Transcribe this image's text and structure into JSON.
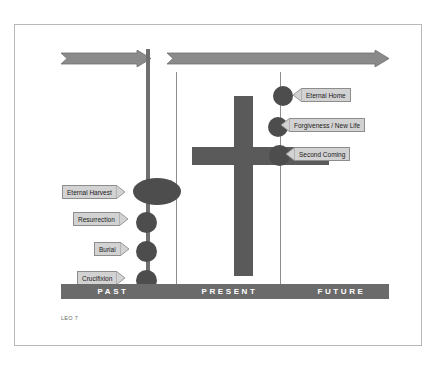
{
  "slide": {
    "footer_caption": "LEO 7",
    "colors": {
      "marker": "#4d4d4d",
      "cross": "#5a5a5a",
      "era_bar": "#6b6b6b",
      "present_line": "#6f6f6f",
      "divider_line": "#8e8e8e",
      "callout_fill": "#d2d2d2",
      "callout_border": "#8d8d8d",
      "arrow_fill": "#8a8a8a",
      "frame_border": "#b9b9b9",
      "background": "#ffffff"
    }
  },
  "timeline": {
    "eras": [
      {
        "label": "PAST",
        "left": 0,
        "width": 104
      },
      {
        "label": "PRESENT",
        "left": 104,
        "width": 129
      },
      {
        "label": "FUTURE",
        "left": 233,
        "width": 95
      }
    ],
    "arrows": [
      {
        "name": "past-arrow",
        "label": ""
      },
      {
        "name": "future-arrow",
        "label": ""
      }
    ]
  },
  "past_events": [
    {
      "label": "Eternal Harvest",
      "marker": "ellipse"
    },
    {
      "label": "Resurrection",
      "marker": "circle"
    },
    {
      "label": "Burial",
      "marker": "circle"
    },
    {
      "label": "Crucifixion",
      "marker": "circle"
    }
  ],
  "future_events": [
    {
      "label": "Eternal Home",
      "marker": "circle"
    },
    {
      "label": "Forgiveness / New Life",
      "marker": "circle"
    },
    {
      "label": "Second Coming",
      "marker": "circle"
    }
  ]
}
